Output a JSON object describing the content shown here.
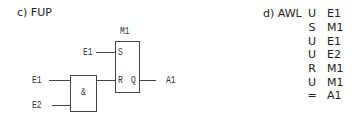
{
  "fup": {
    "title": "c) FUP",
    "sr_block": {
      "name": "M1",
      "set_pin": "S",
      "reset_pin": "R",
      "output_pin": "Q"
    },
    "and_gate": {
      "symbol": "&"
    },
    "inputs": {
      "set_input": "E1",
      "and_input_1": "E1",
      "and_input_2": "E2"
    },
    "output": "A1"
  },
  "awl": {
    "title": "d) AWL",
    "rows": [
      {
        "op": "U",
        "arg": "E1"
      },
      {
        "op": "S",
        "arg": "M1"
      },
      {
        "op": "U",
        "arg": "E1"
      },
      {
        "op": "U",
        "arg": "E2"
      },
      {
        "op": "R",
        "arg": "M1"
      },
      {
        "op": "U",
        "arg": "M1"
      },
      {
        "op": "=",
        "arg": "A1"
      }
    ]
  }
}
